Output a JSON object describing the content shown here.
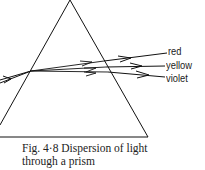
{
  "figure": {
    "caption_line1": "Fig. 4·8  Dispersion of light",
    "caption_line2": "through a prism"
  },
  "diagram": {
    "rays": [
      {
        "label": "red"
      },
      {
        "label": "yellow"
      },
      {
        "label": "violet"
      }
    ],
    "colors": {
      "line": "#111111",
      "background": "#ffffff"
    }
  }
}
